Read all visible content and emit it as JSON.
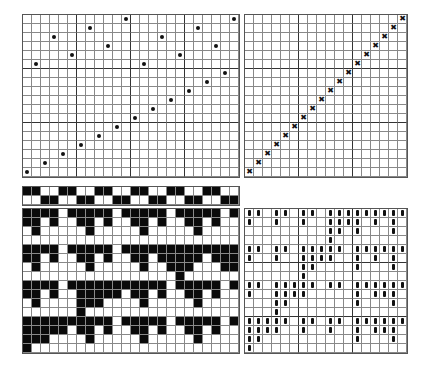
{
  "diagram": {
    "type": "weaving-draft",
    "cell_size_px": 9,
    "threading": {
      "label": "threading",
      "columns": 24,
      "rows": 18,
      "mark": "dot",
      "marks": [
        [
          0,
          11
        ],
        [
          0,
          23
        ],
        [
          1,
          7
        ],
        [
          1,
          19
        ],
        [
          2,
          3
        ],
        [
          2,
          15
        ],
        [
          3,
          9
        ],
        [
          3,
          21
        ],
        [
          4,
          5
        ],
        [
          4,
          17
        ],
        [
          5,
          1
        ],
        [
          5,
          13
        ],
        [
          6,
          22
        ],
        [
          7,
          20
        ],
        [
          8,
          18
        ],
        [
          9,
          16
        ],
        [
          10,
          14
        ],
        [
          11,
          12
        ],
        [
          12,
          10
        ],
        [
          13,
          8
        ],
        [
          14,
          6
        ],
        [
          15,
          4
        ],
        [
          16,
          2
        ],
        [
          17,
          0
        ]
      ]
    },
    "treadling": {
      "label": "tie-up-diagonal",
      "columns": 18,
      "rows": 18,
      "mark": "x",
      "marks": [
        [
          0,
          17
        ],
        [
          1,
          16
        ],
        [
          2,
          15
        ],
        [
          3,
          14
        ],
        [
          4,
          13
        ],
        [
          5,
          12
        ],
        [
          6,
          11
        ],
        [
          7,
          10
        ],
        [
          8,
          9
        ],
        [
          9,
          8
        ],
        [
          10,
          7
        ],
        [
          11,
          6
        ],
        [
          12,
          5
        ],
        [
          13,
          4
        ],
        [
          14,
          3
        ],
        [
          15,
          2
        ],
        [
          16,
          1
        ],
        [
          17,
          0
        ]
      ]
    },
    "strip": {
      "label": "shaft-strip",
      "columns": 24,
      "rows": 2,
      "pattern": [
        "110011001100110011001100",
        "001100110011001100110011"
      ]
    },
    "drawdown": {
      "label": "drawdown",
      "columns": 24,
      "rows": 16,
      "pattern": [
        "111101111101111101111101",
        "110100110100110100110100",
        "010000010000010000010000",
        "000000000000000000000000",
        "111101111101111111111111",
        "110100110100110111110111",
        "010000010000010011100011",
        "000000000000000001000000",
        "111101111111111101111101",
        "110100111110110100110100",
        "010000111000010000010000",
        "000000100000000000000000",
        "111111111101111101111101",
        "111110110100110100110100",
        "111000010000010000010000",
        "100000000000000000000000"
      ]
    },
    "profile": {
      "label": "profile-draft",
      "columns": 18,
      "rows": 16,
      "mark": "bar",
      "marks_by_row": [
        [
          0,
          1,
          3,
          4,
          6,
          7,
          9,
          10,
          11,
          12,
          13,
          14,
          15,
          16,
          17
        ],
        [
          0,
          3,
          6,
          9,
          10,
          11,
          12,
          14,
          16
        ],
        [
          9,
          10,
          12,
          16
        ],
        [
          9
        ],
        [
          0,
          1,
          3,
          4,
          6,
          7,
          8,
          9,
          10,
          12,
          13,
          14,
          15,
          16,
          17
        ],
        [
          0,
          3,
          6,
          7,
          8,
          9,
          12,
          14,
          16
        ],
        [
          6,
          7,
          12,
          16
        ],
        [
          6
        ],
        [
          0,
          1,
          3,
          4,
          5,
          6,
          7,
          9,
          10,
          12,
          13,
          14,
          15,
          16,
          17
        ],
        [
          0,
          3,
          4,
          5,
          6,
          12,
          14,
          15,
          16
        ],
        [
          3,
          4,
          12,
          16
        ],
        [
          3
        ],
        [
          0,
          1,
          2,
          3,
          4,
          6,
          7,
          9,
          10,
          12,
          13,
          14,
          15,
          16,
          17
        ],
        [
          0,
          1,
          2,
          3,
          6,
          9,
          12,
          14,
          15,
          16
        ],
        [
          0,
          1,
          12,
          16
        ],
        [
          0
        ]
      ]
    },
    "colors": {
      "ink": "#0a0a0a",
      "grid_line": "#888888",
      "paper": "#ffffff"
    }
  }
}
